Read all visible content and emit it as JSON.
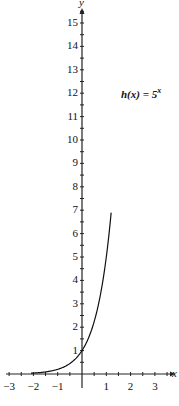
{
  "chart_data": {
    "type": "line",
    "title": "",
    "annotation": "h(x) = 5^x",
    "function": "5^x",
    "xlabel": "x",
    "ylabel": "y",
    "xlim": [
      -3.5,
      3.8
    ],
    "ylim": [
      0,
      15.5
    ],
    "x_ticks": [
      -3,
      -2,
      -1,
      1,
      2,
      3
    ],
    "y_ticks": [
      1,
      2,
      3,
      4,
      5,
      6,
      7,
      8,
      9,
      10,
      11,
      12,
      13,
      14,
      15
    ],
    "grid": false,
    "series": [
      {
        "name": "h(x) = 5^x",
        "x": [
          -2,
          -1.5,
          -1,
          -0.5,
          0,
          0.5,
          1,
          1.2
        ],
        "y": [
          0.04,
          0.09,
          0.2,
          0.45,
          1,
          2.24,
          5,
          6.9
        ]
      }
    ]
  },
  "labels": {
    "annotation_text": "h(x) = 5",
    "annotation_exp": "x",
    "x_axis": "x",
    "y_axis": "y"
  }
}
